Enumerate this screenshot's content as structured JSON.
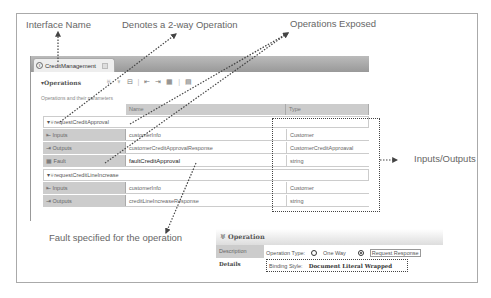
{
  "callouts": {
    "interface_name": "Interface Name",
    "two_way": "Denotes a 2-way Operation",
    "ops_exposed": "Operations Exposed",
    "inputs_outputs": "Inputs/Outputs",
    "fault": "Fault specified for the operation"
  },
  "editor": {
    "tab_label": "CreditManagement",
    "tab_icon": "interface-icon",
    "section_title": "▾Operations",
    "section_subtitle": "Operations and their parameters",
    "columns": {
      "name": "Name",
      "type": "Type"
    },
    "operations": [
      {
        "name": "requestCreditApproval",
        "rows": [
          {
            "kind": "Inputs",
            "name": "customerInfo",
            "type": "Customer"
          },
          {
            "kind": "Outputs",
            "name": "customerCreditApprovalResponse",
            "type": "CustomerCreditApproaval"
          },
          {
            "kind": "Fault",
            "name": "faultCreditApproval",
            "type": "string"
          }
        ]
      },
      {
        "name": "requestCreditLineIncrease",
        "rows": [
          {
            "kind": "Inputs",
            "name": "customerInfo",
            "type": "Customer"
          },
          {
            "kind": "Outputs",
            "name": "creditLineIncreaseResponse",
            "type": "string"
          }
        ]
      }
    ]
  },
  "operation_panel": {
    "title": "Operation",
    "tabs": [
      "Description",
      "Details"
    ],
    "operation_type_label": "Operation Type:",
    "one_way": "One Way",
    "request_response": "Request Response",
    "binding_style_label": "Binding Style:",
    "binding_style_value": "Document Literal Wrapped"
  }
}
